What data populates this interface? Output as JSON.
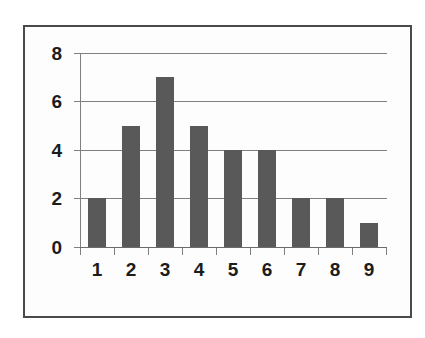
{
  "chart_data": {
    "type": "bar",
    "title": "",
    "subtitle": "",
    "xlabel": "",
    "ylabel": "",
    "categories": [
      "1",
      "2",
      "3",
      "4",
      "5",
      "6",
      "7",
      "8",
      "9"
    ],
    "values": [
      2,
      5,
      7,
      5,
      4,
      4,
      2,
      2,
      1
    ],
    "series": [
      {
        "name": "",
        "values": [
          2,
          5,
          7,
          5,
          4,
          4,
          2,
          2,
          1
        ]
      }
    ],
    "ylim": [
      0,
      8
    ],
    "yticks": [
      0,
      2,
      4,
      6,
      8
    ],
    "ytick_labels": [
      "0",
      "2",
      "4",
      "6",
      "8"
    ],
    "grid": true,
    "grid_axis": "y",
    "legend": false,
    "legend_position": "none",
    "annotations": [],
    "colors": {
      "bar_fill": "#595959",
      "gridline": "#808080",
      "axis_line": "#6b6b6b",
      "axis_text": "#1c1c1c",
      "plot_background": "#fdfdfd",
      "frame_border": "#4a4a4a",
      "page_background": "#ffffff"
    }
  }
}
